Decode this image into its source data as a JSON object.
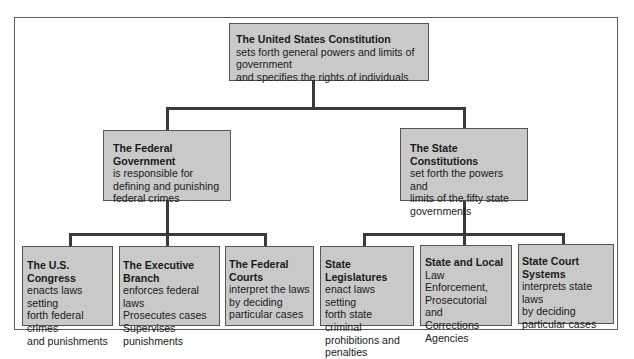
{
  "diagram": {
    "root": {
      "title": "The United States Constitution",
      "lines": [
        "sets forth general powers and limits of government",
        "and specifies the rights of individuals"
      ]
    },
    "federal": {
      "title": "The Federal Government",
      "lines": [
        "is responsible for",
        "defining and punishing",
        "federal crimes"
      ],
      "children": [
        {
          "title": "The U.S. Congress",
          "lines": [
            "enacts laws setting",
            "forth federal crimes",
            "and punishments"
          ]
        },
        {
          "title": "The Executive Branch",
          "lines": [
            "enforces federal laws",
            "Prosecutes cases",
            "Supervises",
            "punishments"
          ]
        },
        {
          "title": "The Federal Courts",
          "lines": [
            "interpret the laws",
            "by deciding",
            "particular cases"
          ]
        }
      ]
    },
    "state": {
      "title": "The State Constitutions",
      "lines": [
        "set forth the powers and",
        "limits of the fifty state",
        "governments"
      ],
      "children": [
        {
          "title": "State Legislatures",
          "lines": [
            "enact laws setting",
            "forth state criminal",
            "prohibitions and",
            "penalties"
          ]
        },
        {
          "title": "State and Local",
          "lines": [
            "Law Enforcement,",
            "Prosecutorial and",
            "Corrections",
            "Agencies"
          ]
        },
        {
          "title": "State Court Systems",
          "lines": [
            "interprets state laws",
            "by deciding",
            "particular cases"
          ]
        }
      ]
    },
    "colors": {
      "box_fill": "#c9c9c9",
      "connector": "#3a3a3a",
      "frame": "#5a5a5a"
    }
  }
}
